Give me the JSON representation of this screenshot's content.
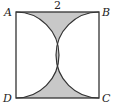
{
  "figure": {
    "type": "geometry-diagram",
    "side_length_label": "2",
    "vertices": {
      "top_left": "A",
      "top_right": "B",
      "bottom_right": "C",
      "bottom_left": "D"
    },
    "colors": {
      "stroke": "#333333",
      "shade": "#c8c8c8",
      "background": "#ffffff"
    }
  }
}
